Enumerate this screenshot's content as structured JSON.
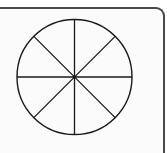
{
  "diagram": {
    "type": "circle-divided-into-equal-sectors",
    "sectors": 8,
    "center": {
      "x": 74.5,
      "y": 77
    },
    "radius": 57.5,
    "stroke_color": "#1a1a1a",
    "frame_color": "#4a4a4a",
    "background_color": "#ffffff",
    "divider_angles_deg": [
      0,
      45,
      90,
      135
    ]
  }
}
